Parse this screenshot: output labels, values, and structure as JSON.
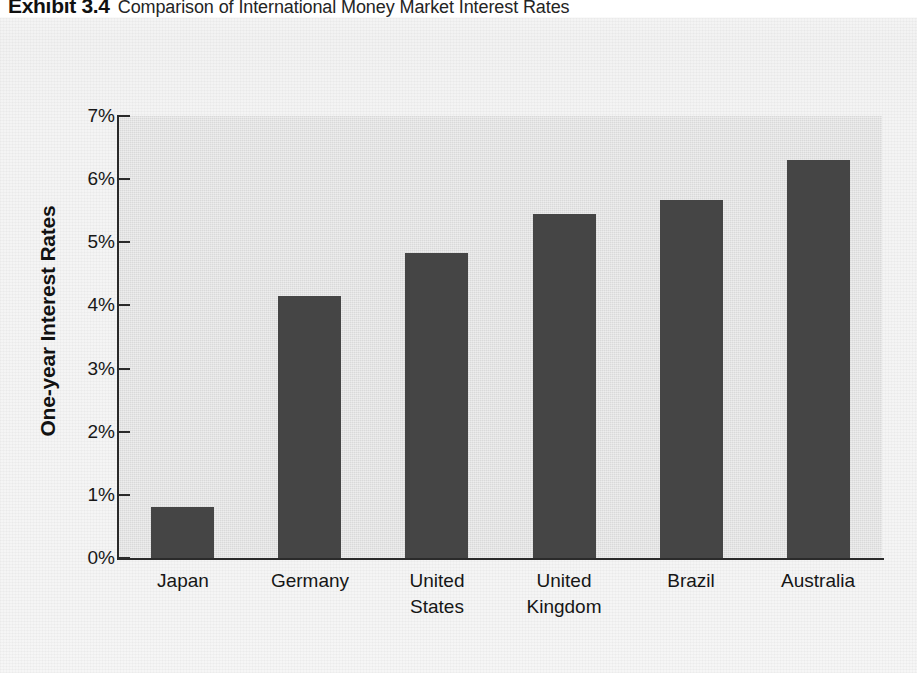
{
  "caption": {
    "exhibit_label": "Exhibit 3.4",
    "exhibit_title": "Comparison of International Money Market Interest Rates"
  },
  "colors": {
    "bar_fill": "#454545",
    "plot_background": "#d9d9d9",
    "axis": "#2a2a2a",
    "page_background": "#f5f5f5"
  },
  "chart_data": {
    "type": "bar",
    "title": "Comparison of International Money Market Interest Rates",
    "xlabel": "",
    "ylabel": "One-year Interest Rates",
    "categories": [
      "Japan",
      "Germany",
      "United States",
      "United Kingdom",
      "Brazil",
      "Australia"
    ],
    "category_lines": [
      [
        "Japan"
      ],
      [
        "Germany"
      ],
      [
        "United",
        "States"
      ],
      [
        "United",
        "Kingdom"
      ],
      [
        "Brazil"
      ],
      [
        "Australia"
      ]
    ],
    "values": [
      0.8,
      4.15,
      4.83,
      5.45,
      5.67,
      6.3
    ],
    "value_unit": "%",
    "ylim": [
      0,
      7
    ],
    "ytick_values": [
      0,
      1,
      2,
      3,
      4,
      5,
      6,
      7
    ],
    "ytick_labels": [
      "0%",
      "1%",
      "2%",
      "3%",
      "4%",
      "5%",
      "6%",
      "7%"
    ],
    "grid": false,
    "legend": false
  }
}
